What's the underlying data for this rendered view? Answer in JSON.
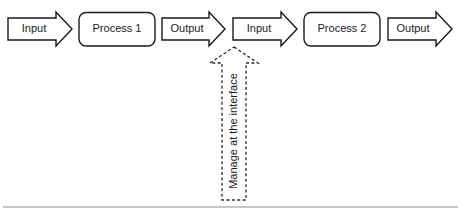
{
  "diagram": {
    "background_color": "#ffffff",
    "stroke_color": "#1a1a1a",
    "dashed_stroke_color": "#2b2b2b",
    "rule_color": "#b4b4b4",
    "flow_row": [
      {
        "kind": "arrow",
        "label": "Input"
      },
      {
        "kind": "process",
        "label": "Process 1"
      },
      {
        "kind": "arrow",
        "label": "Output"
      },
      {
        "kind": "arrow",
        "label": "Input"
      },
      {
        "kind": "process",
        "label": "Process 2"
      },
      {
        "kind": "arrow",
        "label": "Output"
      }
    ],
    "callout": {
      "label": "Manage at the interface",
      "style": "dashed-up-arrow",
      "orientation": "vertical-bottom-to-top"
    }
  }
}
